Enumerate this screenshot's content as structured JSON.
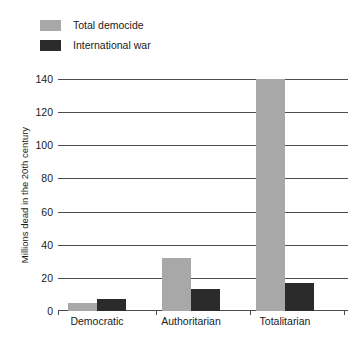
{
  "chart_data": {
    "type": "bar",
    "title": "",
    "subtitle": "",
    "xlabel": "",
    "ylabel": "Millions dead in the 20th century",
    "categories": [
      "Democratic",
      "Authoritarian",
      "Totalitarian"
    ],
    "series": [
      {
        "name": "Total democide",
        "color": "#a8a8a8",
        "values": [
          5,
          32,
          140
        ]
      },
      {
        "name": "International war",
        "color": "#2b2b2b",
        "values": [
          7,
          13,
          17
        ]
      }
    ],
    "ylim": [
      0,
      140
    ],
    "ytick_values": [
      0,
      20,
      40,
      60,
      80,
      100,
      120,
      140
    ],
    "ytick_labels": [
      "0",
      "20",
      "40",
      "60",
      "80",
      "100",
      "120",
      "140"
    ],
    "grid": "horizontal",
    "legend_position": "top-left",
    "annotations": []
  },
  "legend": {
    "items": [
      {
        "label": "Total democide",
        "color": "#a8a8a8"
      },
      {
        "label": "International war",
        "color": "#2b2b2b"
      }
    ]
  },
  "axis": {
    "y_title": "Millions dead in the 20th century"
  }
}
